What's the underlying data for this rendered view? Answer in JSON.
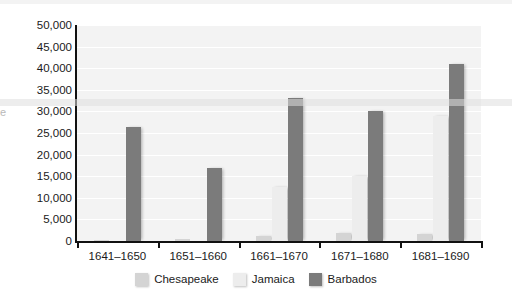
{
  "chart_data": {
    "type": "bar",
    "title": "",
    "xlabel": "",
    "ylabel": "",
    "ylim": [
      0,
      50000
    ],
    "ytick_labels": [
      "0",
      "5,000",
      "10,000",
      "15,000",
      "20,000",
      "25,000",
      "30,000",
      "35,000",
      "40,000",
      "45,000",
      "50,000"
    ],
    "ytick_values": [
      0,
      5000,
      10000,
      15000,
      20000,
      25000,
      30000,
      35000,
      40000,
      45000,
      50000
    ],
    "grid": true,
    "legend_position": "bottom",
    "categories": [
      "1641–1650",
      "1651–1660",
      "1661–1670",
      "1671–1680",
      "1681–1690"
    ],
    "series": [
      {
        "name": "Chesapeake",
        "color": "#d4d4d4",
        "values": [
          300,
          400,
          1200,
          1800,
          1700
        ]
      },
      {
        "name": "Jamaica",
        "color": "#ededed",
        "values": [
          0,
          0,
          12500,
          15000,
          29000
        ]
      },
      {
        "name": "Barbados",
        "color": "#7b7b7b",
        "values": [
          26500,
          16800,
          33000,
          30000,
          41000
        ]
      }
    ]
  },
  "axis": {
    "title_remnant": "e"
  }
}
